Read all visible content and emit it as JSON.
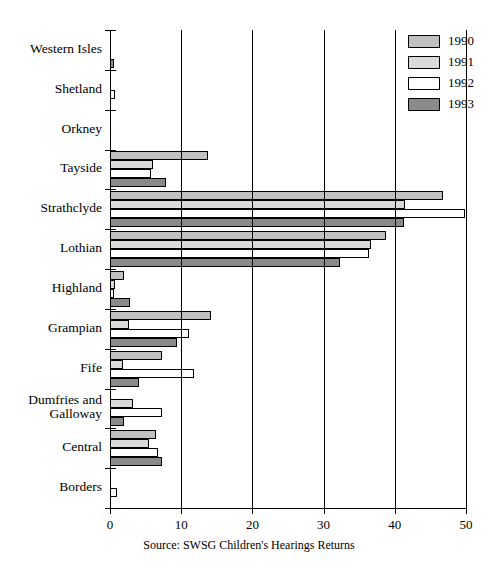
{
  "chart_data": {
    "type": "bar",
    "orientation": "horizontal",
    "title": "",
    "xlabel": "",
    "ylabel": "",
    "xlim": [
      0,
      50
    ],
    "xticks": [
      0,
      10,
      20,
      30,
      40,
      50
    ],
    "xtick_labels": [
      "0",
      "10",
      "20",
      "30",
      "40",
      "50"
    ],
    "grid": true,
    "grid_axis": "x",
    "legend_position": "top-right",
    "categories": [
      "Western Isles",
      "Shetland",
      "Orkney",
      "Tayside",
      "Strathclyde",
      "Lothian",
      "Highland",
      "Grampian",
      "Fife",
      "Dumfries and Galloway",
      "Central",
      "Borders"
    ],
    "series": [
      {
        "name": "1990",
        "color": "#c0c0c0",
        "values": [
          0,
          0,
          0,
          13.7,
          46.7,
          38.7,
          2.0,
          14.2,
          7.3,
          0,
          6.5,
          0
        ]
      },
      {
        "name": "1991",
        "color": "#d9d9d9",
        "values": [
          0,
          0,
          0,
          6.0,
          41.5,
          36.6,
          0.7,
          2.7,
          1.8,
          3.2,
          5.5,
          0
        ]
      },
      {
        "name": "1992",
        "color": "#ffffff",
        "values": [
          0,
          0.7,
          0,
          5.8,
          49.8,
          36.4,
          0.5,
          11.1,
          11.8,
          7.3,
          6.8,
          1.0
        ]
      },
      {
        "name": "1993",
        "color": "#8a8a8a",
        "values": [
          0.6,
          0,
          0,
          7.9,
          41.3,
          32.3,
          2.8,
          9.4,
          4.1,
          2.0,
          7.3,
          0
        ]
      }
    ]
  },
  "legend": {
    "entries": [
      {
        "label": "1990",
        "color": "#c0c0c0"
      },
      {
        "label": "1991",
        "color": "#d9d9d9"
      },
      {
        "label": "1992",
        "color": "#ffffff"
      },
      {
        "label": "1993",
        "color": "#8a8a8a"
      }
    ]
  },
  "source_note": "Source: SWSG Children's Hearings Returns"
}
